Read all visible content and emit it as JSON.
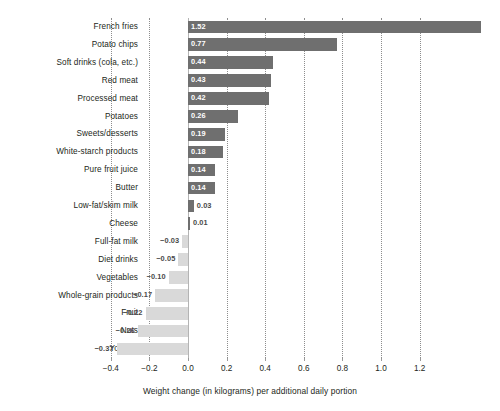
{
  "chart_data": {
    "type": "bar",
    "orientation": "horizontal",
    "title": "",
    "subtitle": "",
    "xlabel": "Weight change (in kilograms) per additional daily portion",
    "ylabel": "",
    "xlim": [
      -0.45,
      1.6
    ],
    "xticks": [
      -0.4,
      -0.2,
      0.0,
      0.2,
      0.4,
      0.6,
      0.8,
      1.0,
      1.2
    ],
    "xtick_labels": [
      "−0.4",
      "−0.2",
      "0.0",
      "0.2",
      "0.4",
      "0.6",
      "0.8",
      "1.0",
      "1.2"
    ],
    "grid": "vertical-dotted",
    "legend": "none",
    "colors": {
      "positive_bar": "#6f6f6f",
      "negative_bar": "#d9d9d9",
      "label_inside": "#ffffff",
      "label_outside": "#4a4a4a",
      "gridline": "#8d8d8d",
      "zero_line": "#b4b4b4",
      "background": "#ffffff",
      "text": "#231f20"
    },
    "categories": [
      "French fries",
      "Potato chips",
      "Soft drinks (cola, etc.)",
      "Red meat",
      "Processed meat",
      "Potatoes",
      "Sweets/desserts",
      "White-starch products",
      "Pure fruit juice",
      "Butter",
      "Low-fat/skim milk",
      "Cheese",
      "Full-fat milk",
      "Diet drinks",
      "Vegetables",
      "Whole-grain products",
      "Fruit",
      "Nuts",
      "Yoghurt"
    ],
    "values": [
      1.52,
      0.77,
      0.44,
      0.43,
      0.42,
      0.26,
      0.19,
      0.18,
      0.14,
      0.14,
      0.03,
      0.01,
      -0.03,
      -0.05,
      -0.1,
      -0.17,
      -0.22,
      -0.26,
      -0.37
    ],
    "value_labels": [
      "1.52",
      "0.77",
      "0.44",
      "0.43",
      "0.42",
      "0.26",
      "0.19",
      "0.18",
      "0.14",
      "0.14",
      "0.03",
      "0.01",
      "−0.03",
      "−0.05",
      "−0.10",
      "−0.17",
      "−0.22",
      "−0.26",
      "−0.37"
    ]
  }
}
